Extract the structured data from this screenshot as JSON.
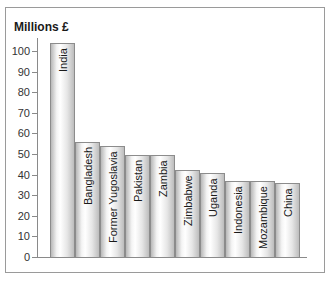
{
  "chart_data": {
    "type": "bar",
    "title": "",
    "ylabel": "Millions £",
    "xlabel": "",
    "ylim": [
      0,
      100
    ],
    "yticks": [
      0,
      10,
      20,
      30,
      40,
      50,
      60,
      70,
      80,
      90,
      100
    ],
    "grid": false,
    "legend": null,
    "label_position": "inside-bar-top-rotated",
    "categories": [
      "India",
      "Bangladesh",
      "Former Yugoslavia",
      "Pakistan",
      "Zambia",
      "Zimbabwe",
      "Uganda",
      "Indonesia",
      "Mozambique",
      "China"
    ],
    "values": [
      104,
      56,
      54,
      49.5,
      49.5,
      42,
      41,
      37,
      37,
      36
    ]
  },
  "axis": {
    "y_title": "Millions £",
    "ticks": [
      "0",
      "10",
      "20",
      "30",
      "40",
      "50",
      "60",
      "70",
      "80",
      "90",
      "100"
    ]
  },
  "bars": [
    {
      "label": "India",
      "value": 104
    },
    {
      "label": "Bangladesh",
      "value": 56
    },
    {
      "label": "Former Yugoslavia",
      "value": 54
    },
    {
      "label": "Pakistan",
      "value": 49.5
    },
    {
      "label": "Zambia",
      "value": 49.5
    },
    {
      "label": "Zimbabwe",
      "value": 42
    },
    {
      "label": "Uganda",
      "value": 41
    },
    {
      "label": "Indonesia",
      "value": 37
    },
    {
      "label": "Mozambique",
      "value": 37
    },
    {
      "label": "China",
      "value": 36
    }
  ]
}
